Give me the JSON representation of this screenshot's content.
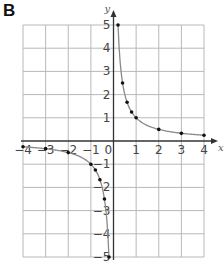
{
  "panel_label": "B",
  "chart_data": {
    "type": "line",
    "title": "",
    "function": "y = 1/x",
    "xlabel": "x",
    "ylabel": "y",
    "xlim": [
      -4,
      4
    ],
    "ylim": [
      -5,
      5
    ],
    "grid": true,
    "x_ticks": [
      "-4",
      "-3",
      "-2",
      "-1",
      "0",
      "1",
      "2",
      "3",
      "4"
    ],
    "y_ticks": [
      "5",
      "4",
      "3",
      "2",
      "1",
      "-1",
      "-2",
      "-3",
      "-4",
      "-5"
    ],
    "series": [
      {
        "name": "positive branch",
        "points": [
          [
            0.2,
            5
          ],
          [
            0.4,
            2.5
          ],
          [
            0.6,
            1.67
          ],
          [
            0.8,
            1.25
          ],
          [
            1,
            1
          ],
          [
            2,
            0.5
          ],
          [
            3,
            0.33
          ],
          [
            4,
            0.25
          ]
        ]
      },
      {
        "name": "negative branch",
        "points": [
          [
            -4,
            -0.25
          ],
          [
            -3,
            -0.33
          ],
          [
            -2,
            -0.5
          ],
          [
            -1,
            -1
          ],
          [
            -0.8,
            -1.25
          ],
          [
            -0.6,
            -1.67
          ],
          [
            -0.4,
            -2.5
          ],
          [
            -0.2,
            -5
          ]
        ]
      }
    ],
    "colors": {
      "grid": "#b8b8b8",
      "axis": "#333333",
      "curve": "#8a8a8a",
      "points": "#111111"
    }
  }
}
